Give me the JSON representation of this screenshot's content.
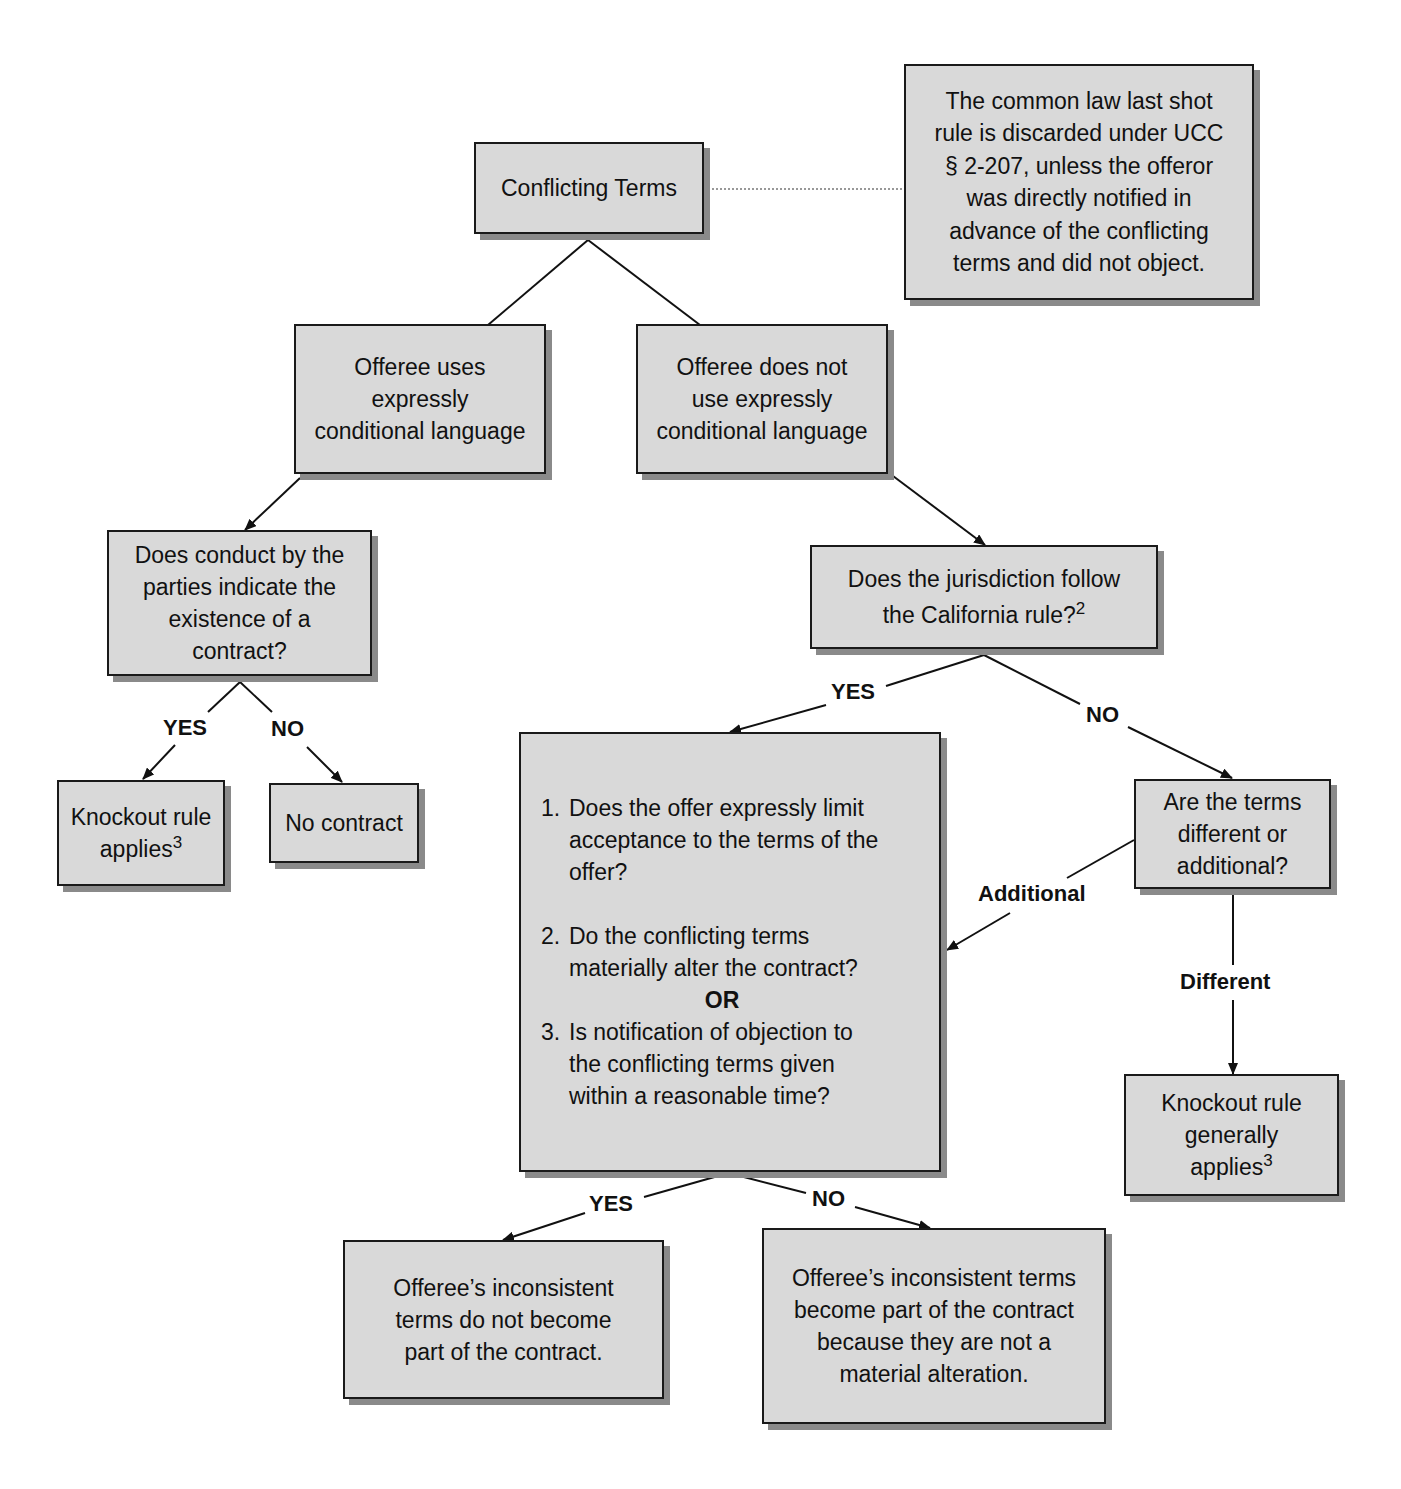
{
  "diagram": {
    "title_node": "Conflicting Terms",
    "note": "The common law last shot\nrule is discarded under UCC\n§ 2-207, unless the offeror\nwas directly notified in\nadvance of the conflicting\nterms and did not object.",
    "branch_left": "Offeree uses\nexpressly\nconditional language",
    "branch_right": "Offeree does not\nuse expressly\nconditional language",
    "conduct_question": "Does conduct by the\nparties indicate the\nexistence of a\ncontract?",
    "knockout_applies": {
      "text": "Knockout rule\napplies",
      "footnote": "3"
    },
    "no_contract": "No contract",
    "california_question": {
      "text": "Does the jurisdiction follow\nthe California rule?",
      "footnote": "2"
    },
    "questions": [
      {
        "num": "1.",
        "text": "Does the offer expressly limit\nacceptance to the terms of the\noffer?"
      },
      {
        "num": "2.",
        "text": "Do the conflicting terms\nmaterially alter the contract?"
      },
      {
        "num": "3.",
        "text": "Is notification of objection to\nthe conflicting terms given\nwithin a reasonable time?"
      }
    ],
    "or_label": "OR",
    "terms_question": "Are the terms\ndifferent or\nadditional?",
    "knockout_generally": {
      "text": "Knockout rule\ngenerally\napplies",
      "footnote": "3"
    },
    "result_yes": "Offeree’s inconsistent\nterms do not become\npart of the contract.",
    "result_no": "Offeree’s inconsistent terms\nbecome part of the contract\nbecause they are not a\nmaterial alteration."
  },
  "edge_labels": {
    "conduct_yes": "YES",
    "conduct_no": "NO",
    "california_yes": "YES",
    "california_no": "NO",
    "additional": "Additional",
    "different": "Different",
    "questions_yes": "YES",
    "questions_no": "NO"
  },
  "colors": {
    "box_fill": "#d9d9d9",
    "box_border": "#1a1a1a",
    "box_shadow": "#8a8a8a",
    "line": "#111111"
  }
}
